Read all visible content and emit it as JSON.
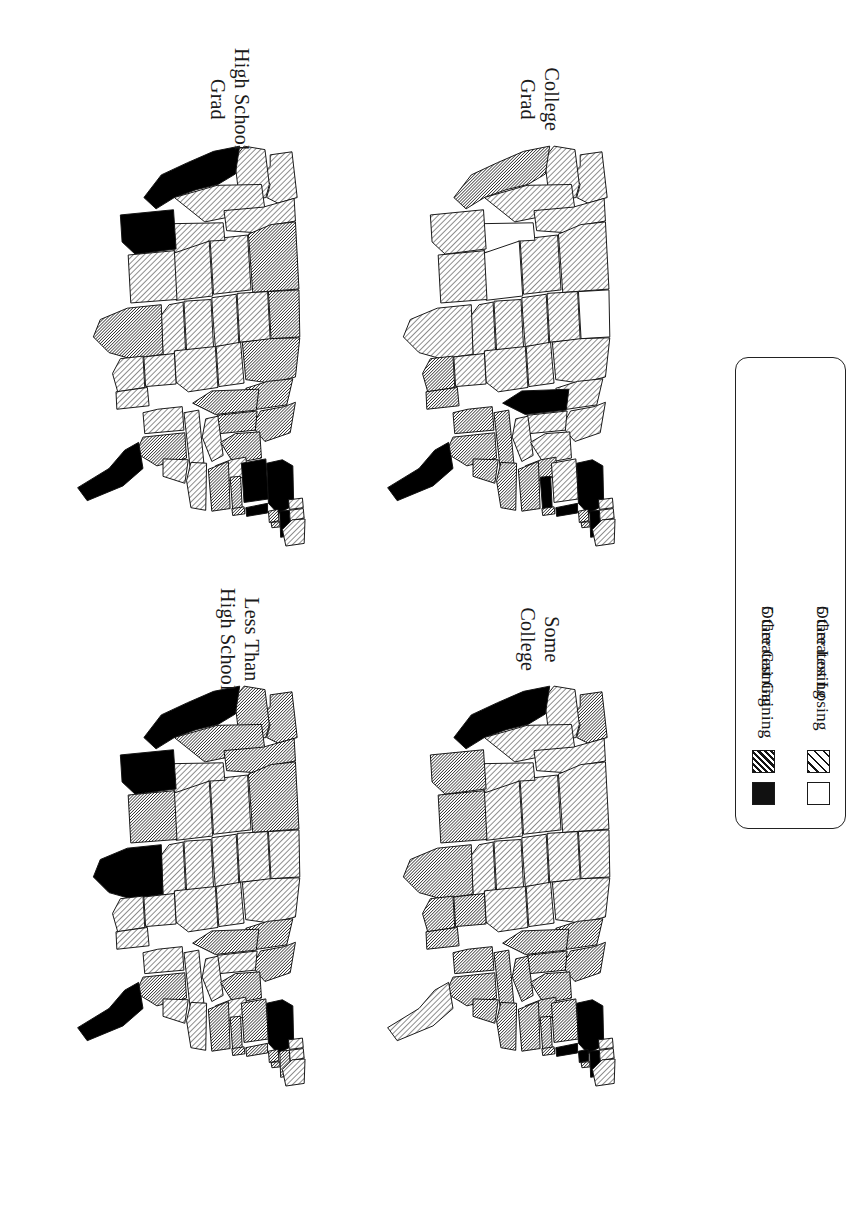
{
  "figure": {
    "orientation": "rotated-90-clockwise",
    "background_color": "#ffffff",
    "ink_color": "#111111"
  },
  "panels": [
    {
      "id": "less-than-high-school",
      "label": "Less Than\nHigh School",
      "position": "bottom-left"
    },
    {
      "id": "high-school-grad",
      "label": "High School\nGrad",
      "position": "top-left"
    },
    {
      "id": "some-college",
      "label": "Some\nCollege",
      "position": "bottom-right"
    },
    {
      "id": "college-grad",
      "label": "College\nGrad",
      "position": "top-right"
    }
  ],
  "legend": {
    "items": [
      {
        "label": "5 Greatest Gaining",
        "swatch": "black",
        "color": "#111111"
      },
      {
        "label": "Other Gaining",
        "swatch": "hatch-dark",
        "color": "#141414"
      },
      {
        "label": "5 Greatest Losing",
        "swatch": "white",
        "color": "#ffffff"
      },
      {
        "label": "Other Losing",
        "swatch": "hatch-light",
        "color": "#141414"
      }
    ]
  },
  "chart_data": {
    "type": "map",
    "title": "",
    "subtitle": "",
    "map_type": "choropleth",
    "region": "United States (48 contiguous states)",
    "projection_note": "Maps drawn rotated 90 degrees on the printed page",
    "categories": [
      "5 Greatest Gaining",
      "Other Gaining",
      "5 Greatest Losing",
      "Other Losing"
    ],
    "category_fills": {
      "5 Greatest Gaining": "black",
      "Other Gaining": "hatch-dark",
      "5 Greatest Losing": "white",
      "Other Losing": "hatch-light"
    },
    "legend_position": "right-center",
    "grid": false,
    "panels": [
      {
        "name": "Less Than High School",
        "states": {
          "WA": "Other Gaining",
          "OR": "Other Gaining",
          "CA": "5 Greatest Gaining",
          "NV": "Other Gaining",
          "ID": "Other Gaining",
          "MT": "Other Gaining",
          "WY": "Other Losing",
          "UT": "Other Losing",
          "AZ": "5 Greatest Gaining",
          "CO": "Other Losing",
          "NM": "Other Gaining",
          "ND": "Other Losing",
          "SD": "Other Losing",
          "NE": "Other Losing",
          "KS": "Other Losing",
          "OK": "Other Losing",
          "TX": "5 Greatest Gaining",
          "MN": "Other Losing",
          "IA": "Other Losing",
          "MO": "Other Losing",
          "AR": "Other Losing",
          "LA": "Other Losing",
          "WI": "Other Gaining",
          "IL": "Other Gaining",
          "MS": "Other Losing",
          "MI": "Other Gaining",
          "IN": "Other Losing",
          "KY": "Other Losing",
          "TN": "Other Losing",
          "AL": "Other Losing",
          "OH": "Other Gaining",
          "WV": "Other Losing",
          "GA": "Other Gaining",
          "FL": "5 Greatest Gaining",
          "SC": "Other Losing",
          "NC": "Other Losing",
          "VA": "Other Gaining",
          "PA": "Other Gaining",
          "NY": "5 Greatest Gaining",
          "MD": "Other Gaining",
          "DE": "Other Gaining",
          "NJ": "Other Gaining",
          "CT": "Other Gaining",
          "RI": "Other Gaining",
          "MA": "Other Gaining",
          "VT": "Other Losing",
          "NH": "Other Losing",
          "ME": "Other Losing"
        }
      },
      {
        "name": "High School Grad",
        "states": {
          "WA": "Other Losing",
          "OR": "Other Losing",
          "CA": "5 Greatest Gaining",
          "NV": "Other Losing",
          "ID": "Other Losing",
          "MT": "Other Gaining",
          "WY": "Other Losing",
          "UT": "Other Losing",
          "AZ": "5 Greatest Gaining",
          "CO": "Other Losing",
          "NM": "Other Losing",
          "ND": "Other Gaining",
          "SD": "Other Losing",
          "NE": "Other Losing",
          "KS": "Other Losing",
          "OK": "Other Losing",
          "TX": "Other Gaining",
          "MN": "Other Gaining",
          "IA": "Other Losing",
          "MO": "Other Losing",
          "AR": "Other Losing",
          "LA": "Other Losing",
          "WI": "Other Gaining",
          "IL": "Other Gaining",
          "MS": "Other Losing",
          "MI": "Other Gaining",
          "IN": "Other Gaining",
          "KY": "Other Losing",
          "TN": "Other Losing",
          "AL": "Other Losing",
          "OH": "Other Gaining",
          "WV": "Other Losing",
          "GA": "Other Gaining",
          "FL": "5 Greatest Gaining",
          "SC": "Other Losing",
          "NC": "Other Losing",
          "VA": "Other Gaining",
          "PA": "5 Greatest Gaining",
          "NY": "5 Greatest Gaining",
          "MD": "Other Gaining",
          "DE": "Other Gaining",
          "NJ": "5 Greatest Gaining",
          "CT": "Other Gaining",
          "RI": "Other Gaining",
          "MA": "5 Greatest Gaining",
          "VT": "Other Losing",
          "NH": "Other Losing",
          "ME": "Other Losing"
        }
      },
      {
        "name": "Some College",
        "states": {
          "WA": "Other Gaining",
          "OR": "Other Losing",
          "CA": "5 Greatest Gaining",
          "NV": "Other Losing",
          "ID": "Other Losing",
          "MT": "Other Losing",
          "WY": "Other Losing",
          "UT": "Other Losing",
          "AZ": "Other Gaining",
          "CO": "Other Losing",
          "NM": "Other Gaining",
          "ND": "Other Losing",
          "SD": "Other Losing",
          "NE": "Other Losing",
          "KS": "Other Losing",
          "OK": "Other Losing",
          "TX": "Other Gaining",
          "MN": "Other Losing",
          "IA": "Other Losing",
          "MO": "Other Losing",
          "AR": "Other Gaining",
          "LA": "Other Gaining",
          "WI": "Other Gaining",
          "IL": "Other Gaining",
          "MS": "Other Gaining",
          "MI": "Other Gaining",
          "IN": "Other Gaining",
          "KY": "Other Gaining",
          "TN": "Other Gaining",
          "AL": "Other Gaining",
          "OH": "Other Gaining",
          "WV": "Other Gaining",
          "GA": "Other Gaining",
          "FL": "Other Losing",
          "SC": "Other Gaining",
          "NC": "Other Gaining",
          "VA": "Other Gaining",
          "PA": "Other Gaining",
          "NY": "5 Greatest Gaining",
          "MD": "Other Gaining",
          "DE": "Other Gaining",
          "NJ": "5 Greatest Gaining",
          "CT": "5 Greatest Gaining",
          "RI": "Other Gaining",
          "MA": "5 Greatest Gaining",
          "VT": "Other Losing",
          "NH": "Other Losing",
          "ME": "Other Losing"
        }
      },
      {
        "name": "College Grad",
        "states": {
          "WA": "Other Losing",
          "OR": "Other Losing",
          "CA": "Other Gaining",
          "NV": "Other Losing",
          "ID": "Other Losing",
          "MT": "Other Losing",
          "WY": "Other Losing",
          "UT": "5 Greatest Losing",
          "AZ": "Other Losing",
          "CO": "5 Greatest Losing",
          "NM": "Other Losing",
          "ND": "5 Greatest Losing",
          "SD": "Other Losing",
          "NE": "Other Losing",
          "KS": "Other Losing",
          "OK": "Other Losing",
          "TX": "Other Losing",
          "MN": "Other Losing",
          "IA": "Other Losing",
          "MO": "Other Losing",
          "AR": "Other Losing",
          "LA": "Other Gaining",
          "WI": "Other Losing",
          "IL": "5 Greatest Gaining",
          "MS": "Other Gaining",
          "MI": "Other Losing",
          "IN": "Other Losing",
          "KY": "Other Losing",
          "TN": "Other Gaining",
          "AL": "Other Gaining",
          "OH": "Other Losing",
          "WV": "Other Gaining",
          "GA": "Other Gaining",
          "FL": "5 Greatest Gaining",
          "SC": "Other Gaining",
          "NC": "Other Gaining",
          "VA": "Other Gaining",
          "PA": "Other Losing",
          "NY": "5 Greatest Gaining",
          "MD": "5 Greatest Gaining",
          "DE": "Other Gaining",
          "NJ": "5 Greatest Gaining",
          "CT": "Other Gaining",
          "RI": "Other Gaining",
          "MA": "5 Greatest Gaining",
          "VT": "Other Losing",
          "NH": "Other Losing",
          "ME": "Other Losing"
        }
      }
    ]
  }
}
